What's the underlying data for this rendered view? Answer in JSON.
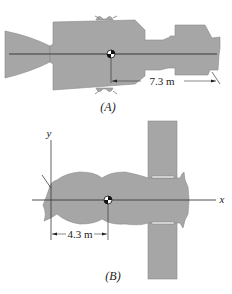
{
  "figures": [
    {
      "id": "A",
      "caption": "(A)",
      "dimension": {
        "label": "7.3 m",
        "value": 7.3,
        "unit": "m"
      },
      "view": "side view of spacecraft with center of mass marker"
    },
    {
      "id": "B",
      "caption": "(B)",
      "dimension": {
        "label": "4.3 m",
        "value": 4.3,
        "unit": "m"
      },
      "axes": {
        "x_label": "x",
        "y_label": "y"
      },
      "view": "spacecraft with solar panel, x-y axes"
    }
  ],
  "colors": {
    "body_fill": "#a6a6a6",
    "body_edge": "#8a8a8a",
    "line": "#3a3a3a",
    "text": "#222222",
    "background": "#ffffff"
  }
}
